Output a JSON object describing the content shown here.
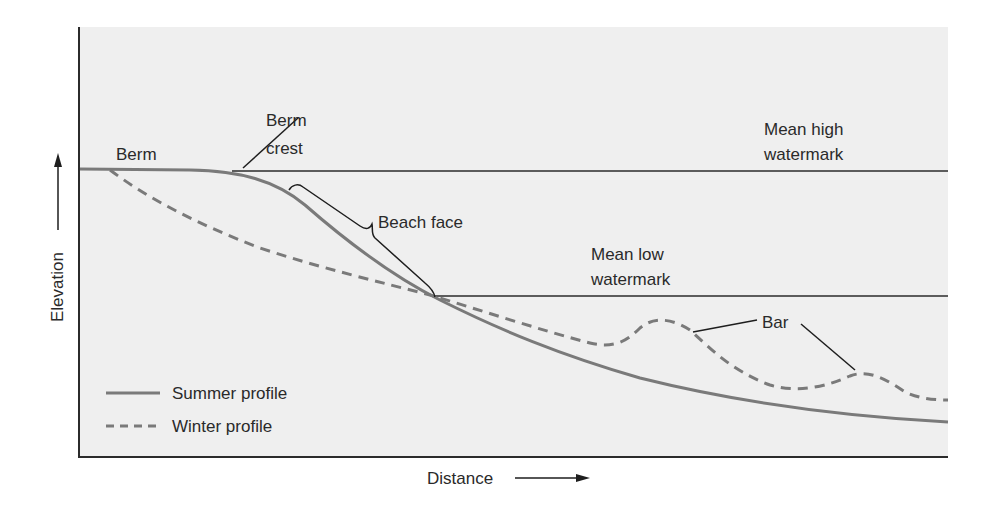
{
  "diagram": {
    "colors": {
      "background": "#ffffff",
      "panel": "#efefef",
      "axis": "#2b2b2b",
      "profile": "#7a7a7a",
      "leader": "#1e1e1e",
      "text": "#2a2a2a"
    },
    "axes": {
      "y_label": "Elevation",
      "x_label": "Distance"
    },
    "labels": {
      "berm": "Berm",
      "berm_crest_line1": "Berm",
      "berm_crest_line2": "crest",
      "beach_face": "Beach face",
      "mean_high_line1": "Mean high",
      "mean_high_line2": "watermark",
      "mean_low_line1": "Mean low",
      "mean_low_line2": "watermark",
      "bar": "Bar"
    },
    "legend": {
      "items": [
        {
          "label": "Summer profile",
          "style": "solid"
        },
        {
          "label": "Winter profile",
          "style": "dashed"
        }
      ]
    }
  }
}
